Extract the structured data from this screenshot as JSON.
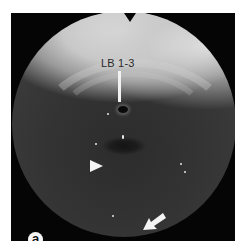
{
  "figure": {
    "panel_label": "a",
    "annotation_label": "LB 1-3",
    "markers": {
      "pointer_line": "white vertical line indicating LB 1-3 orifice",
      "arrowhead": "white arrowhead pointing right",
      "arrow": "white arrow pointing down-left"
    },
    "colors": {
      "background_page": "#ffffff",
      "frame": "#050505",
      "annotation_white": "#f4f4f4",
      "label_text": "#2a2a2a"
    }
  }
}
